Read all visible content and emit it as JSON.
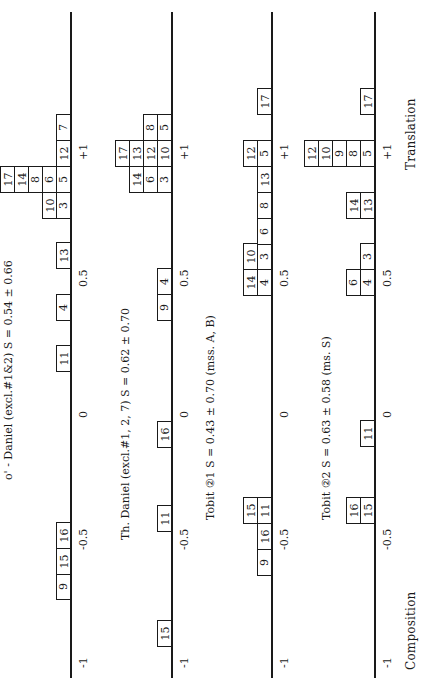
{
  "chart_data": {
    "type": "table",
    "axis": {
      "ticks": [
        "-1",
        "-0.5",
        "0",
        "0.5",
        "+1"
      ],
      "tick_values": [
        -1,
        -0.5,
        0,
        0.5,
        1
      ],
      "left_label": "Composition",
      "right_label": "Translation"
    },
    "panels": [
      {
        "title": "ο' - Daniel (excl.#1&2)   S =   0.54 ± 0.66",
        "name": "OG Daniel",
        "S": "0.54 ± 0.66",
        "items": [
          {
            "label": "9",
            "value": -0.7,
            "stack": 1
          },
          {
            "label": "15",
            "value": -0.6,
            "stack": 1
          },
          {
            "label": "16",
            "value": -0.5,
            "stack": 1
          },
          {
            "label": "11",
            "value": 0.2,
            "stack": 1
          },
          {
            "label": "4",
            "value": 0.4,
            "stack": 1
          },
          {
            "label": "13",
            "value": 0.6,
            "stack": 1
          },
          {
            "label": "3",
            "value": 0.8,
            "stack": 1
          },
          {
            "label": "10",
            "value": 0.8,
            "stack": 2
          },
          {
            "label": "5",
            "value": 0.9,
            "stack": 1
          },
          {
            "label": "6",
            "value": 0.9,
            "stack": 2
          },
          {
            "label": "8",
            "value": 0.9,
            "stack": 3
          },
          {
            "label": "14",
            "value": 0.9,
            "stack": 4
          },
          {
            "label": "17",
            "value": 0.9,
            "stack": 5
          },
          {
            "label": "12",
            "value": 1.0,
            "stack": 1
          },
          {
            "label": "7",
            "value": 1.1,
            "stack": 1
          }
        ]
      },
      {
        "title": "Th.  Daniel (excl.#1, 2, 7)   S = 0.62  ± 0.70",
        "name": "Th. Daniel",
        "S": "0.62 ± 0.70",
        "items": [
          {
            "label": "15",
            "value": -0.9,
            "stack": 1
          },
          {
            "label": "11",
            "value": -0.4,
            "stack": 1
          },
          {
            "label": "16",
            "value": -0.05,
            "stack": 1
          },
          {
            "label": "9",
            "value": 0.4,
            "stack": 1
          },
          {
            "label": "4",
            "value": 0.5,
            "stack": 1
          },
          {
            "label": "3",
            "value": 0.9,
            "stack": 1
          },
          {
            "label": "6",
            "value": 0.9,
            "stack": 2
          },
          {
            "label": "14",
            "value": 0.9,
            "stack": 3
          },
          {
            "label": "10",
            "value": 1.0,
            "stack": 1
          },
          {
            "label": "12",
            "value": 1.0,
            "stack": 2
          },
          {
            "label": "13",
            "value": 1.0,
            "stack": 3
          },
          {
            "label": "17",
            "value": 1.0,
            "stack": 4
          },
          {
            "label": "5",
            "value": 1.1,
            "stack": 1
          },
          {
            "label": "8",
            "value": 1.1,
            "stack": 2
          }
        ]
      },
      {
        "title": "Tobit ②1  S = 0.43 ± 0.70     (mss. A, B)",
        "name": "Tobit G1",
        "S": "0.43 ± 0.70",
        "items": [
          {
            "label": "9",
            "value": -0.65,
            "stack": 1
          },
          {
            "label": "16",
            "value": -0.55,
            "stack": 1
          },
          {
            "label": "11",
            "value": -0.45,
            "stack": 1
          },
          {
            "label": "15",
            "value": -0.45,
            "stack": 2
          },
          {
            "label": "4",
            "value": 0.5,
            "stack": 1
          },
          {
            "label": "14",
            "value": 0.5,
            "stack": 2
          },
          {
            "label": "3",
            "value": 0.6,
            "stack": 1
          },
          {
            "label": "10",
            "value": 0.6,
            "stack": 2
          },
          {
            "label": "6",
            "value": 0.7,
            "stack": 1
          },
          {
            "label": "8",
            "value": 0.8,
            "stack": 1
          },
          {
            "label": "13",
            "value": 0.9,
            "stack": 1
          },
          {
            "label": "5",
            "value": 1.0,
            "stack": 1
          },
          {
            "label": "12",
            "value": 1.0,
            "stack": 2
          },
          {
            "label": "17",
            "value": 1.2,
            "stack": 1
          }
        ]
      },
      {
        "title": "Tobit ②2   S = 0.63 ± 0.58     (ms. S)",
        "name": "Tobit G2",
        "S": "0.63 ± 0.58",
        "items": [
          {
            "label": "15",
            "value": -0.45,
            "stack": 1
          },
          {
            "label": "16",
            "value": -0.45,
            "stack": 2
          },
          {
            "label": "11",
            "value": -0.05,
            "stack": 1
          },
          {
            "label": "4",
            "value": 0.5,
            "stack": 1
          },
          {
            "label": "6",
            "value": 0.5,
            "stack": 2
          },
          {
            "label": "3",
            "value": 0.6,
            "stack": 1
          },
          {
            "label": "13",
            "value": 0.8,
            "stack": 1
          },
          {
            "label": "14",
            "value": 0.8,
            "stack": 2
          },
          {
            "label": "5",
            "value": 1.0,
            "stack": 1
          },
          {
            "label": "8",
            "value": 1.0,
            "stack": 2
          },
          {
            "label": "9",
            "value": 1.0,
            "stack": 3
          },
          {
            "label": "10",
            "value": 1.0,
            "stack": 4
          },
          {
            "label": "12",
            "value": 1.0,
            "stack": 5
          },
          {
            "label": "17",
            "value": 1.2,
            "stack": 1
          }
        ]
      }
    ]
  },
  "layout": {
    "panels": [
      {
        "axis_x": 70,
        "title_x": 3,
        "title_y": 685,
        "ticks_x": 78,
        "boxes": [
          {
            "label": "9",
            "row": 1,
            "y": 573
          },
          {
            "label": "15",
            "row": 1,
            "y": 548
          },
          {
            "label": "16",
            "row": 1,
            "y": 522
          },
          {
            "label": "11",
            "row": 1,
            "y": 345
          },
          {
            "label": "4",
            "row": 1,
            "y": 294
          },
          {
            "label": "13",
            "row": 1,
            "y": 242
          },
          {
            "label": "3",
            "row": 1,
            "y": 192
          },
          {
            "label": "10",
            "row": 2,
            "y": 192
          },
          {
            "label": "5",
            "row": 1,
            "y": 166
          },
          {
            "label": "6",
            "row": 2,
            "y": 166
          },
          {
            "label": "8",
            "row": 3,
            "y": 166
          },
          {
            "label": "14",
            "row": 4,
            "y": 166
          },
          {
            "label": "17",
            "row": 5,
            "y": 166
          },
          {
            "label": "12",
            "row": 1,
            "y": 140
          },
          {
            "label": "7",
            "row": 1,
            "y": 114
          }
        ]
      },
      {
        "axis_x": 171,
        "title_x": 120,
        "title_y": 520,
        "ticks_x": 179,
        "boxes": [
          {
            "label": "15",
            "row": 1,
            "y": 620
          },
          {
            "label": "11",
            "row": 1,
            "y": 505
          },
          {
            "label": "16",
            "row": 1,
            "y": 421
          },
          {
            "label": "9",
            "row": 1,
            "y": 294
          },
          {
            "label": "4",
            "row": 1,
            "y": 268
          },
          {
            "label": "3",
            "row": 1,
            "y": 166
          },
          {
            "label": "6",
            "row": 2,
            "y": 166
          },
          {
            "label": "14",
            "row": 3,
            "y": 166
          },
          {
            "label": "10",
            "row": 1,
            "y": 140
          },
          {
            "label": "12",
            "row": 2,
            "y": 140
          },
          {
            "label": "13",
            "row": 3,
            "y": 140
          },
          {
            "label": "17",
            "row": 4,
            "y": 140
          },
          {
            "label": "5",
            "row": 1,
            "y": 114
          },
          {
            "label": "8",
            "row": 2,
            "y": 114
          }
        ]
      },
      {
        "axis_x": 271,
        "title_x": 205,
        "title_y": 520,
        "ticks_x": 279,
        "boxes": [
          {
            "label": "9",
            "row": 1,
            "y": 549
          },
          {
            "label": "16",
            "row": 1,
            "y": 523
          },
          {
            "label": "11",
            "row": 1,
            "y": 497
          },
          {
            "label": "15",
            "row": 2,
            "y": 497
          },
          {
            "label": "4",
            "row": 1,
            "y": 269
          },
          {
            "label": "14",
            "row": 2,
            "y": 269
          },
          {
            "label": "3",
            "row": 1,
            "y": 243
          },
          {
            "label": "10",
            "row": 2,
            "y": 243
          },
          {
            "label": "6",
            "row": 1,
            "y": 218
          },
          {
            "label": "8",
            "row": 1,
            "y": 192
          },
          {
            "label": "13",
            "row": 1,
            "y": 166
          },
          {
            "label": "5",
            "row": 1,
            "y": 140
          },
          {
            "label": "12",
            "row": 2,
            "y": 140
          },
          {
            "label": "17",
            "row": 1,
            "y": 88
          }
        ]
      },
      {
        "axis_x": 374,
        "title_x": 321,
        "title_y": 520,
        "ticks_x": 382,
        "boxes": [
          {
            "label": "15",
            "row": 1,
            "y": 497
          },
          {
            "label": "16",
            "row": 2,
            "y": 497
          },
          {
            "label": "11",
            "row": 1,
            "y": 420
          },
          {
            "label": "4",
            "row": 1,
            "y": 269
          },
          {
            "label": "6",
            "row": 2,
            "y": 269
          },
          {
            "label": "3",
            "row": 1,
            "y": 243
          },
          {
            "label": "13",
            "row": 1,
            "y": 192
          },
          {
            "label": "14",
            "row": 2,
            "y": 192
          },
          {
            "label": "5",
            "row": 1,
            "y": 140
          },
          {
            "label": "8",
            "row": 2,
            "y": 140
          },
          {
            "label": "9",
            "row": 3,
            "y": 140
          },
          {
            "label": "10",
            "row": 4,
            "y": 140
          },
          {
            "label": "12",
            "row": 5,
            "y": 140
          },
          {
            "label": "17",
            "row": 1,
            "y": 88
          }
        ]
      }
    ],
    "tick_y": [
      668,
      550,
      418,
      287,
      160
    ],
    "axis_top": 12,
    "axis_bottom": 678,
    "box_w": 14,
    "box_h": 26
  },
  "footer": {
    "left_label": "Composition",
    "right_label": "Translation"
  }
}
